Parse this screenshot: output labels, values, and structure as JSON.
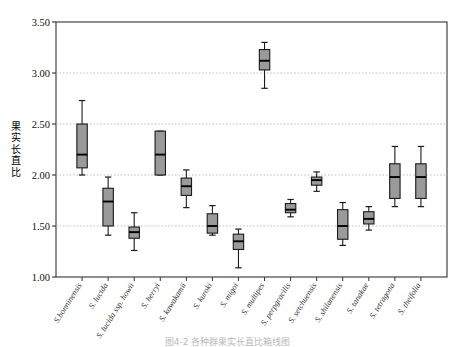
{
  "figure": {
    "ylabel": "果实长直比",
    "caption": "图4-2 各种群果实长直比箱线图"
  },
  "chart_data": {
    "type": "box",
    "title": "",
    "xlabel": "",
    "ylabel": "果实长直比",
    "ylim": [
      1.0,
      3.5
    ],
    "yticks": [
      1.0,
      1.5,
      2.0,
      2.5,
      3.0,
      3.5
    ],
    "ytick_labels": [
      "1.00",
      "1.50",
      "2.00",
      "2.50",
      "3.00",
      "3.50"
    ],
    "grid": "horizontal-dotted",
    "legend": "none",
    "categories": [
      "S.bonninensis",
      "S. lucida",
      "S. lucida ssp. howii",
      "S. herryi",
      "S. kawakamii",
      "S. kuroki",
      "S. migoi",
      "S. multipes",
      "S. perpgracilis",
      "S. setchuensis",
      "S. shilanensis",
      "S. tanakae",
      "S. tetragona",
      "S. theifolia"
    ],
    "boxes": [
      {
        "label": "S.bonninensis",
        "whisker_low": 2.0,
        "q1": 2.07,
        "median": 2.2,
        "q3": 2.5,
        "whisker_high": 2.73
      },
      {
        "label": "S. lucida",
        "whisker_low": 1.41,
        "q1": 1.5,
        "median": 1.74,
        "q3": 1.87,
        "whisker_high": 1.98
      },
      {
        "label": "S. lucida ssp. howii",
        "whisker_low": 1.26,
        "q1": 1.38,
        "median": 1.44,
        "q3": 1.49,
        "whisker_high": 1.63
      },
      {
        "label": "S. herryi",
        "whisker_low": 2.0,
        "q1": 2.0,
        "median": 2.2,
        "q3": 2.43,
        "whisker_high": 2.43
      },
      {
        "label": "S. kawakamii",
        "whisker_low": 1.68,
        "q1": 1.8,
        "median": 1.89,
        "q3": 1.97,
        "whisker_high": 2.05
      },
      {
        "label": "S. kuroki",
        "whisker_low": 1.41,
        "q1": 1.43,
        "median": 1.5,
        "q3": 1.62,
        "whisker_high": 1.7
      },
      {
        "label": "S. migoi",
        "whisker_low": 1.09,
        "q1": 1.27,
        "median": 1.35,
        "q3": 1.42,
        "whisker_high": 1.47
      },
      {
        "label": "S. multipes",
        "whisker_low": 2.85,
        "q1": 3.03,
        "median": 3.12,
        "q3": 3.23,
        "whisker_high": 3.3
      },
      {
        "label": "S. perpgracilis",
        "whisker_low": 1.59,
        "q1": 1.63,
        "median": 1.66,
        "q3": 1.72,
        "whisker_high": 1.76
      },
      {
        "label": "S. setchuensis",
        "whisker_low": 1.84,
        "q1": 1.9,
        "median": 1.95,
        "q3": 1.98,
        "whisker_high": 2.03
      },
      {
        "label": "S. shilanensis",
        "whisker_low": 1.31,
        "q1": 1.37,
        "median": 1.5,
        "q3": 1.66,
        "whisker_high": 1.73
      },
      {
        "label": "S. tanakae",
        "whisker_low": 1.46,
        "q1": 1.52,
        "median": 1.57,
        "q3": 1.64,
        "whisker_high": 1.69
      },
      {
        "label": "S. tetragona",
        "whisker_low": 1.69,
        "q1": 1.77,
        "median": 1.98,
        "q3": 2.11,
        "whisker_high": 2.28
      },
      {
        "label": "S. theifolia",
        "whisker_low": 1.69,
        "q1": 1.77,
        "median": 1.98,
        "q3": 2.11,
        "whisker_high": 2.28
      }
    ],
    "colors": {
      "box_fill": "#9a9a9a",
      "box_edge": "#1b1b1b",
      "median": "#000000",
      "whisker": "#1b1b1b",
      "grid": "#b0b0b0",
      "axis": "#333333",
      "background": "#ffffff"
    }
  }
}
